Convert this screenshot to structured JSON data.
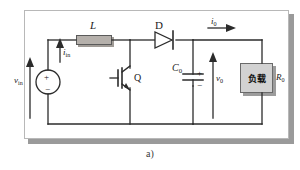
{
  "figure": {
    "caption": "a)",
    "type": "boost-converter-schematic"
  },
  "colors": {
    "wire": "#2b2b2b",
    "frame_border": "#b8b8b8",
    "frame_shadow": "#9a9a9a",
    "component_fill": "#d2d2d2",
    "inductor_fill": "#b5b0ab",
    "background": "#ffffff"
  },
  "components": {
    "source": {
      "name": "input-voltage-source",
      "label": "v",
      "label_sub": "in",
      "plus": "+",
      "minus": "−"
    },
    "input_current": {
      "name": "input-current",
      "label": "i",
      "label_sub": "in"
    },
    "inductor": {
      "name": "inductor",
      "label": "L"
    },
    "transistor": {
      "name": "switching-transistor",
      "label": "Q"
    },
    "diode": {
      "name": "diode",
      "label": "D"
    },
    "output_current": {
      "name": "output-current",
      "label": "i",
      "label_sub": "0"
    },
    "capacitor": {
      "name": "output-capacitor",
      "label": "C",
      "label_sub": "0",
      "plus": "+",
      "minus": "−"
    },
    "output_voltage": {
      "name": "output-voltage",
      "label": "v",
      "label_sub": "0"
    },
    "load": {
      "name": "load-block",
      "label": "负载"
    },
    "load_resistance": {
      "name": "load-resistance",
      "label": "R",
      "label_sub": "0"
    }
  }
}
